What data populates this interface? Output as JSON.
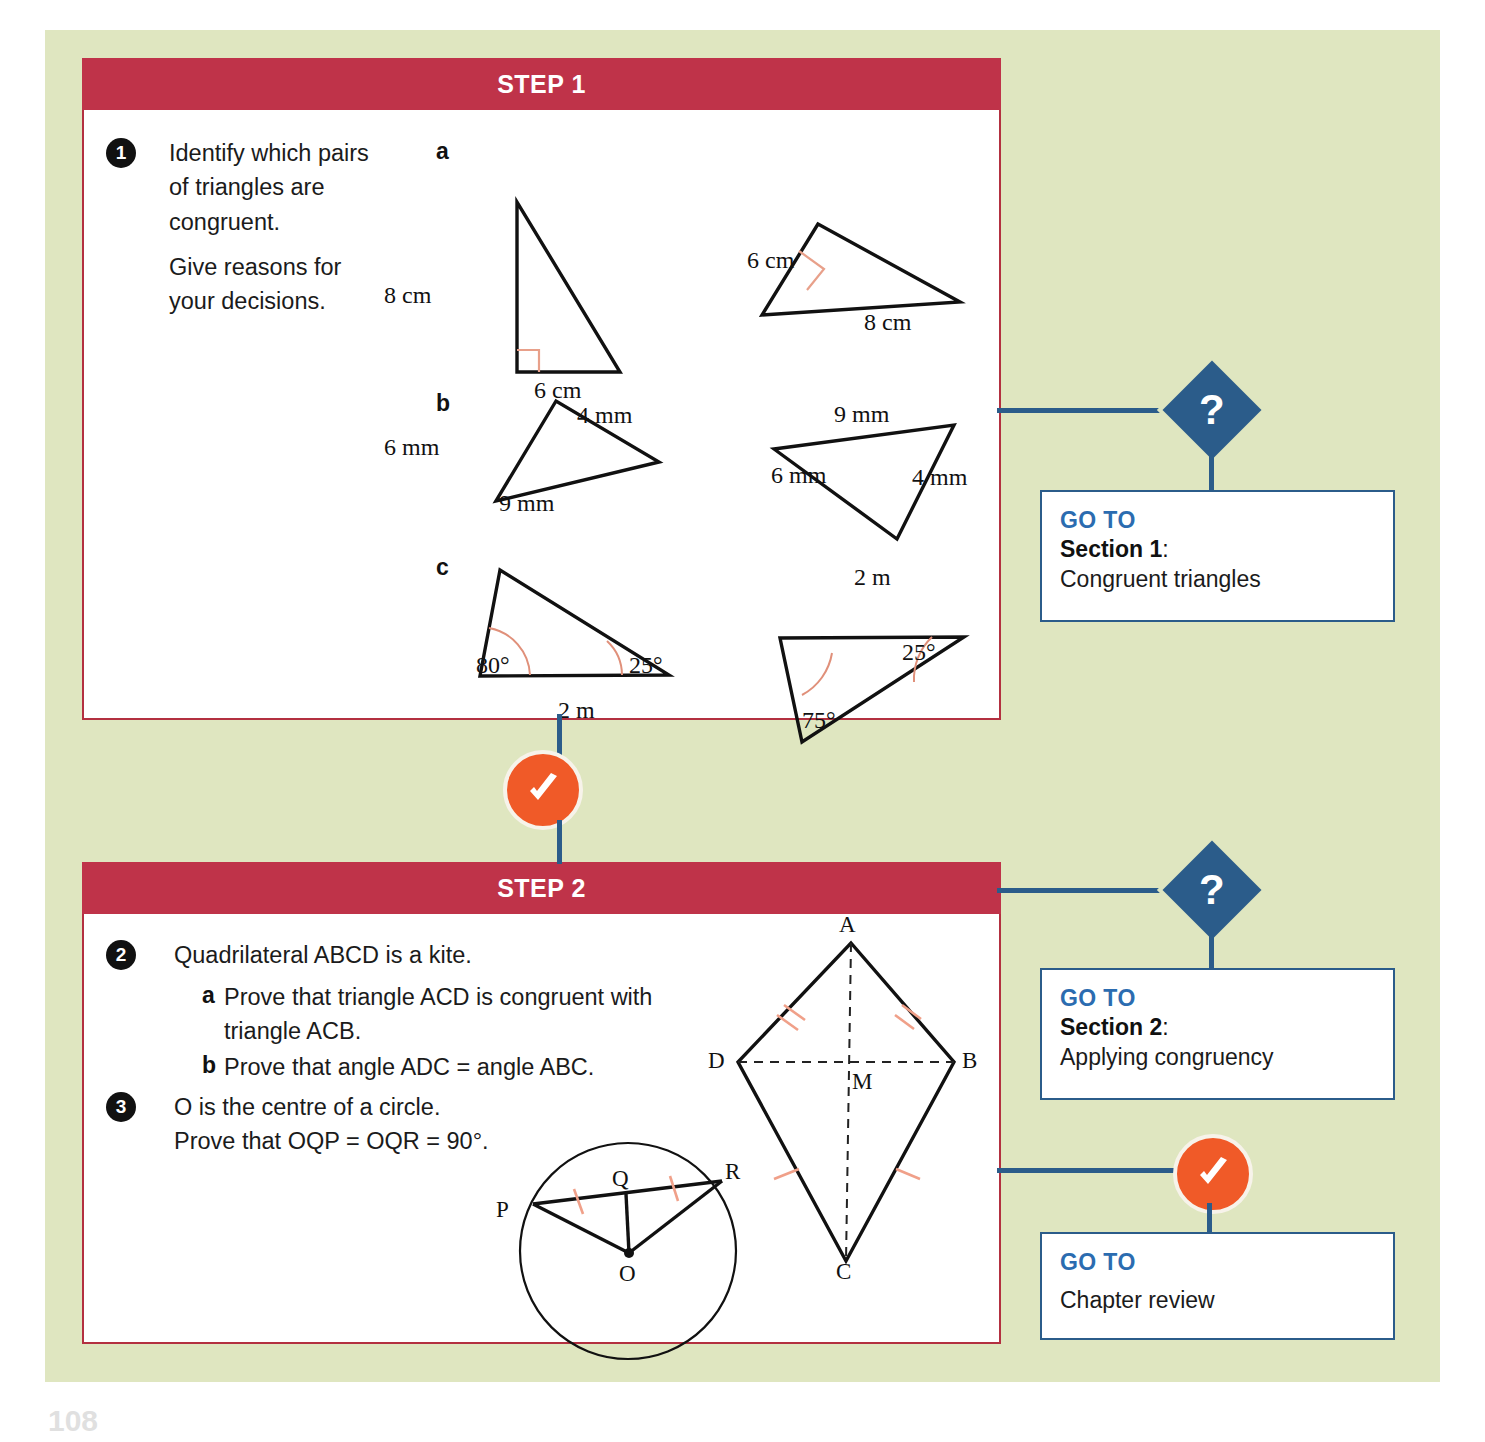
{
  "page": {
    "background_color": "#dfe6c0",
    "page_number": "108"
  },
  "steps": [
    {
      "title": "STEP 1",
      "questions": [
        {
          "number": "1",
          "lines": [
            "Identify which pairs",
            "of triangles are",
            "congruent.",
            "Give reasons for",
            "your decisions."
          ]
        }
      ],
      "parts": [
        {
          "letter": "a",
          "figures": [
            {
              "labels": [
                "8 cm",
                "6 cm"
              ],
              "right_angle": true
            },
            {
              "labels": [
                "6 cm",
                "8 cm"
              ],
              "right_angle": true
            }
          ]
        },
        {
          "letter": "b",
          "figures": [
            {
              "labels": [
                "4 mm",
                "6 mm",
                "9 mm"
              ]
            },
            {
              "labels": [
                "9 mm",
                "6 mm",
                "4 mm"
              ]
            }
          ]
        },
        {
          "letter": "c",
          "figures": [
            {
              "labels": [
                "80°",
                "25°",
                "2 m"
              ]
            },
            {
              "labels": [
                "2 m",
                "25°",
                "75°"
              ]
            }
          ]
        }
      ]
    },
    {
      "title": "STEP 2",
      "questions": [
        {
          "number": "2",
          "lines": [
            "Quadrilateral ABCD is a kite."
          ],
          "subparts": [
            {
              "letter": "a",
              "lines": [
                "Prove that triangle ACD is congruent with",
                "triangle ACB."
              ]
            },
            {
              "letter": "b",
              "lines": [
                "Prove that angle ADC = angle ABC."
              ]
            }
          ]
        },
        {
          "number": "3",
          "lines": [
            "O is the centre of a circle.",
            "Prove that OQP = OQR = 90°."
          ]
        }
      ],
      "kite_labels": {
        "a": "A",
        "b": "B",
        "c": "C",
        "d": "D",
        "m": "M"
      },
      "circle_labels": {
        "p": "P",
        "q": "Q",
        "r": "R",
        "o": "O"
      }
    }
  ],
  "flow": {
    "question_icon": "?",
    "tick_icon": "check-mark",
    "accent_blue": "#2b5c8a",
    "accent_orange": "#f05a28",
    "header_red": "#bf3349",
    "goto_boxes": [
      {
        "label": "GO TO",
        "section": "Section 1",
        "colon": ":",
        "desc": "Congruent triangles"
      },
      {
        "label": "GO TO",
        "section": "Section 2",
        "colon": ":",
        "desc": "Applying congruency"
      },
      {
        "label": "GO TO",
        "section": "",
        "colon": "",
        "desc": "Chapter review"
      }
    ]
  }
}
